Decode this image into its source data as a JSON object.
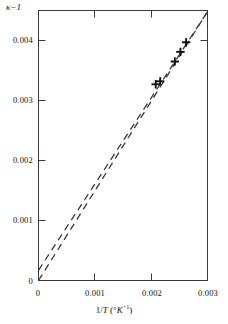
{
  "chart_data": {
    "type": "scatter",
    "title": "",
    "subtitle": "",
    "xlabel": "1/T (°K⁻¹)",
    "ylabel": "κ − 1",
    "xlabel_parts": {
      "prefix": "1/",
      "ital_var": "T",
      "unit_open": " (°",
      "unit_sym": "K",
      "unit_exp": "−1",
      "unit_close": ")"
    },
    "ylabel_parts": {
      "symbol": "κ",
      "operator": "−",
      "value": "1"
    },
    "xlim": [
      0,
      0.003
    ],
    "ylim": [
      0,
      0.0045
    ],
    "xticks": [
      0,
      0.001,
      0.002,
      0.003
    ],
    "xtick_labels": [
      "0",
      "0.001",
      "0.002",
      "0.003"
    ],
    "yticks": [
      0,
      0.001,
      0.002,
      0.003,
      0.004
    ],
    "ytick_labels": [
      "0",
      "0.001",
      "0.002",
      "0.003",
      "0.004"
    ],
    "grid": false,
    "legend": "none",
    "frame": "box",
    "tick_direction": "in",
    "marker": "plus",
    "series": [
      {
        "name": "measured points",
        "style": "plus-markers",
        "x": [
          0.00208,
          0.00216,
          0.00242,
          0.00252,
          0.00262
        ],
        "y": [
          0.00327,
          0.00332,
          0.00365,
          0.00381,
          0.00397
        ]
      },
      {
        "name": "fit line A",
        "style": "dashed",
        "x": [
          0.0,
          0.003
        ],
        "y": [
          0.0,
          0.00448
        ]
      },
      {
        "name": "fit line B",
        "style": "dashed",
        "x": [
          0.0,
          0.003
        ],
        "y": [
          0.00017,
          0.00448
        ]
      }
    ],
    "colors": {
      "axis": "#3a3a3a",
      "marker": "#111111",
      "line": "#3a3a3a",
      "background": "#ffffff"
    }
  }
}
